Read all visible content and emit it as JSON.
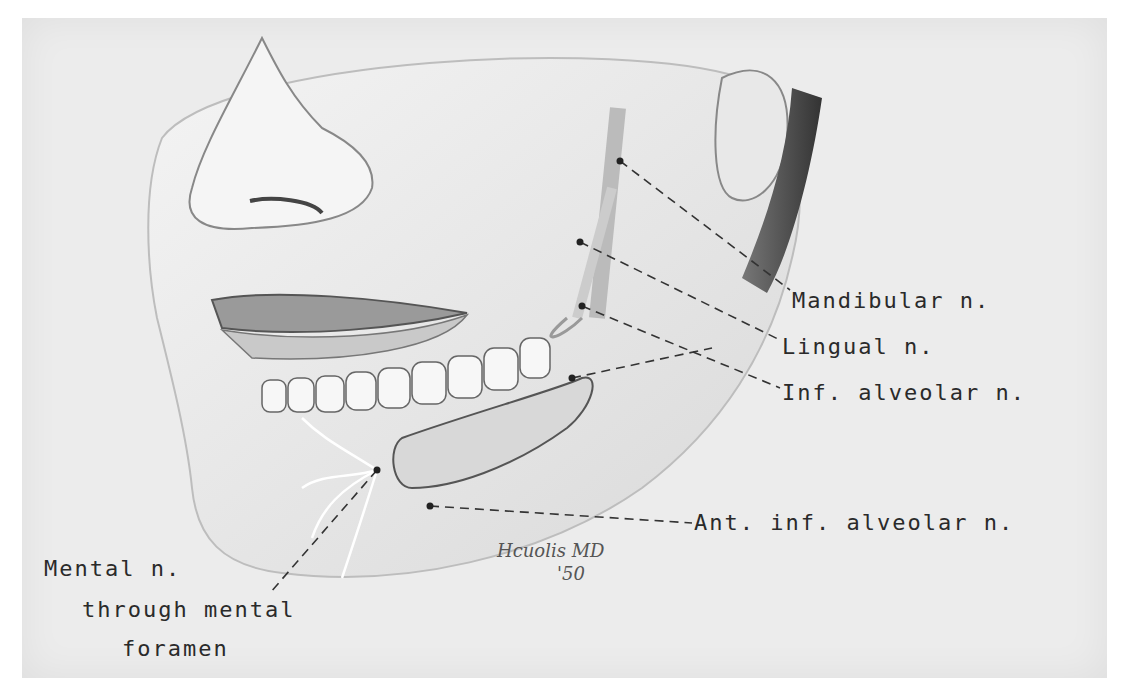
{
  "figure": {
    "background": "#ececec",
    "ink": "#2a2a2a"
  },
  "labels": {
    "mandibular": "Mandibular n.",
    "lingual": "Lingual n.",
    "inf_alveolar": "Inf. alveolar n.",
    "ant_inf_alveolar": "Ant. inf. alveolar n.",
    "mental_line1": "Mental n.",
    "mental_line2": "through mental",
    "mental_line3": "foramen"
  },
  "signature": {
    "name": "Hcuolis MD",
    "year": "'50"
  }
}
